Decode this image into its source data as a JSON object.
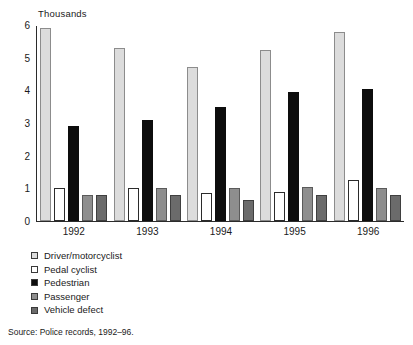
{
  "chart_data": {
    "type": "bar",
    "title": "",
    "subtitle": "",
    "xlabel": "",
    "ylabel": "Thousands",
    "categories": [
      "1992",
      "1993",
      "1994",
      "1995",
      "1996"
    ],
    "ylim": [
      0,
      6
    ],
    "yticks": [
      "0",
      "1",
      "2",
      "3",
      "4",
      "5",
      "6"
    ],
    "grid": false,
    "legend_position": "below-left",
    "series": [
      {
        "name": "Driver/motorcyclist",
        "color": "#dcdcdc",
        "values": [
          5.9,
          5.3,
          4.7,
          5.25,
          5.8
        ]
      },
      {
        "name": "Pedal cyclist",
        "color": "#ffffff",
        "values": [
          1.0,
          1.0,
          0.85,
          0.9,
          1.25
        ]
      },
      {
        "name": "Pedestrian",
        "color": "#0d0d0d",
        "values": [
          2.9,
          3.1,
          3.5,
          3.95,
          4.05
        ]
      },
      {
        "name": "Passenger",
        "color": "#8e8e8e",
        "values": [
          0.8,
          1.0,
          1.0,
          1.05,
          1.0
        ]
      },
      {
        "name": "Vehicle defect",
        "color": "#6b6b6b",
        "values": [
          0.8,
          0.8,
          0.65,
          0.8,
          0.8
        ]
      }
    ],
    "source": "Source: Police records, 1992–96."
  }
}
